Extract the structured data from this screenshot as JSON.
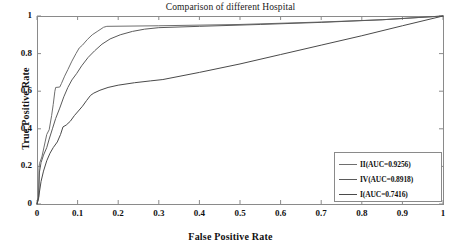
{
  "chart_data": {
    "type": "line",
    "title": "Comparison of different Hospital",
    "xlabel": "False Positive Rate",
    "ylabel": "True Positive Rate",
    "xlim": [
      0,
      1
    ],
    "ylim": [
      0,
      1
    ],
    "grid": false,
    "legend_position": "lower-right",
    "xticks": [
      "0",
      "0.1",
      "0.2",
      "0.3",
      "0.4",
      "0.5",
      "0.6",
      "0.7",
      "0.8",
      "0.9",
      "1"
    ],
    "xtick_values": [
      0,
      0.1,
      0.2,
      0.3,
      0.4,
      0.5,
      0.6,
      0.7,
      0.8,
      0.9,
      1
    ],
    "yticks": [
      "0",
      "0.2",
      "0.4",
      "0.6",
      "0.8",
      "1"
    ],
    "ytick_values": [
      0,
      0.2,
      0.4,
      0.6,
      0.8,
      1
    ],
    "series": [
      {
        "name": "II(AUC=0.9256)",
        "label": "II(AUC=0.9256)",
        "auc": 0.9256,
        "color": "#6e6e6e",
        "points": [
          [
            0.0,
            0.0
          ],
          [
            0.004,
            0.04
          ],
          [
            0.005,
            0.19
          ],
          [
            0.006,
            0.215
          ],
          [
            0.012,
            0.25
          ],
          [
            0.02,
            0.33
          ],
          [
            0.024,
            0.37
          ],
          [
            0.03,
            0.395
          ],
          [
            0.036,
            0.47
          ],
          [
            0.04,
            0.53
          ],
          [
            0.044,
            0.6
          ],
          [
            0.046,
            0.62
          ],
          [
            0.056,
            0.622
          ],
          [
            0.06,
            0.64
          ],
          [
            0.068,
            0.68
          ],
          [
            0.076,
            0.715
          ],
          [
            0.086,
            0.76
          ],
          [
            0.096,
            0.8
          ],
          [
            0.104,
            0.83
          ],
          [
            0.112,
            0.845
          ],
          [
            0.124,
            0.875
          ],
          [
            0.136,
            0.9
          ],
          [
            0.15,
            0.92
          ],
          [
            0.164,
            0.94
          ],
          [
            0.172,
            0.945
          ],
          [
            0.3,
            0.948
          ],
          [
            0.5,
            0.955
          ],
          [
            0.7,
            0.968
          ],
          [
            0.85,
            0.98
          ],
          [
            1.0,
            1.0
          ]
        ]
      },
      {
        "name": "IV(AUC=0.8918)",
        "label": "IV(AUC=0.8918)",
        "auc": 0.8918,
        "color": "#5a5a5a",
        "points": [
          [
            0.0,
            0.0
          ],
          [
            0.004,
            0.03
          ],
          [
            0.006,
            0.17
          ],
          [
            0.01,
            0.22
          ],
          [
            0.016,
            0.26
          ],
          [
            0.024,
            0.3
          ],
          [
            0.03,
            0.345
          ],
          [
            0.038,
            0.4
          ],
          [
            0.046,
            0.455
          ],
          [
            0.056,
            0.51
          ],
          [
            0.066,
            0.57
          ],
          [
            0.076,
            0.62
          ],
          [
            0.086,
            0.66
          ],
          [
            0.098,
            0.695
          ],
          [
            0.11,
            0.735
          ],
          [
            0.126,
            0.78
          ],
          [
            0.142,
            0.815
          ],
          [
            0.16,
            0.85
          ],
          [
            0.18,
            0.878
          ],
          [
            0.205,
            0.9
          ],
          [
            0.235,
            0.918
          ],
          [
            0.265,
            0.93
          ],
          [
            0.3,
            0.938
          ],
          [
            0.4,
            0.945
          ],
          [
            0.55,
            0.955
          ],
          [
            0.7,
            0.966
          ],
          [
            0.85,
            0.98
          ],
          [
            1.0,
            1.0
          ]
        ]
      },
      {
        "name": "I(AUC=0.7416)",
        "label": "I(AUC=0.7416)",
        "auc": 0.7416,
        "color": "#4a4a4a",
        "points": [
          [
            0.0,
            0.0
          ],
          [
            0.004,
            0.035
          ],
          [
            0.01,
            0.12
          ],
          [
            0.016,
            0.175
          ],
          [
            0.024,
            0.23
          ],
          [
            0.032,
            0.27
          ],
          [
            0.04,
            0.3
          ],
          [
            0.05,
            0.33
          ],
          [
            0.058,
            0.37
          ],
          [
            0.064,
            0.41
          ],
          [
            0.072,
            0.42
          ],
          [
            0.082,
            0.44
          ],
          [
            0.092,
            0.47
          ],
          [
            0.104,
            0.5
          ],
          [
            0.112,
            0.52
          ],
          [
            0.122,
            0.55
          ],
          [
            0.132,
            0.578
          ],
          [
            0.14,
            0.59
          ],
          [
            0.155,
            0.605
          ],
          [
            0.175,
            0.62
          ],
          [
            0.2,
            0.632
          ],
          [
            0.24,
            0.645
          ],
          [
            0.28,
            0.655
          ],
          [
            0.31,
            0.662
          ],
          [
            0.4,
            0.7
          ],
          [
            0.5,
            0.745
          ],
          [
            0.6,
            0.795
          ],
          [
            0.7,
            0.845
          ],
          [
            0.8,
            0.895
          ],
          [
            0.9,
            0.948
          ],
          [
            1.0,
            1.0
          ]
        ]
      }
    ]
  },
  "axes": {
    "plot_left": 37,
    "plot_right": 443,
    "plot_top": 16,
    "plot_bottom": 204,
    "frame_color": "#8a8a8a"
  }
}
